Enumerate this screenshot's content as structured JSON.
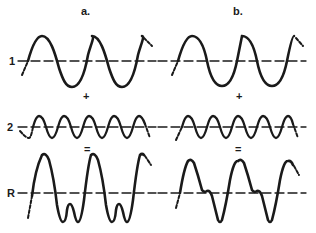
{
  "columns": [
    {
      "label": "a.",
      "x": 96,
      "y": 4
    },
    {
      "label": "b.",
      "x": 237,
      "y": 4
    }
  ],
  "rows": [
    {
      "label": "1",
      "y": 61
    },
    {
      "label": "2",
      "y": 127
    },
    {
      "label": "R",
      "y": 193
    }
  ],
  "operators": {
    "plus_a": "+",
    "plus_b": "+",
    "equals_a": "=",
    "equals_b": "="
  },
  "colors": {
    "ink": "#1a1a1a",
    "background": "#ffffff"
  }
}
